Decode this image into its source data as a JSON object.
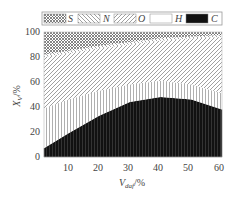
{
  "chart_data": {
    "type": "area",
    "stacked": true,
    "title": "",
    "xlabel": "V_daf/%",
    "ylabel": "X_V/%",
    "xlim": [
      2,
      60
    ],
    "ylim": [
      0,
      100
    ],
    "xticks": [
      10,
      20,
      30,
      40,
      50,
      60
    ],
    "yticks": [
      0,
      20,
      40,
      60,
      80,
      100
    ],
    "grid": false,
    "legend_position": "top",
    "x": [
      2,
      10,
      20,
      30,
      40,
      50,
      60
    ],
    "series": [
      {
        "name": "C",
        "pattern": "solid-black",
        "values": [
          7,
          19,
          33,
          44,
          48,
          46,
          38
        ]
      },
      {
        "name": "H",
        "pattern": "white-vertical-lines",
        "values": [
          32,
          27,
          20,
          14,
          13,
          12,
          13
        ]
      },
      {
        "name": "O",
        "pattern": "diagonal-hatch",
        "values": [
          41,
          37,
          34,
          32,
          32,
          37,
          45
        ]
      },
      {
        "name": "N",
        "pattern": "back-diagonal-hatch",
        "values": [
          2,
          2,
          2,
          2,
          2,
          1.5,
          1.5
        ]
      },
      {
        "name": "S",
        "pattern": "crosshatch",
        "values": [
          18,
          15,
          11,
          8,
          5,
          3.5,
          2.5
        ]
      }
    ]
  },
  "legend": {
    "items": [
      {
        "label": "S",
        "pattern": "crosshatch"
      },
      {
        "label": "N",
        "pattern": "back-diagonal-hatch"
      },
      {
        "label": "O",
        "pattern": "diagonal-hatch"
      },
      {
        "label": "H",
        "pattern": "white"
      },
      {
        "label": "C",
        "pattern": "solid-black"
      }
    ]
  },
  "axes": {
    "xlabel_main": "V",
    "xlabel_sub": "daf",
    "xlabel_unit": "/%",
    "ylabel_main": "X",
    "ylabel_sub": "V",
    "ylabel_unit": "/%",
    "xtick_labels": [
      "10",
      "20",
      "30",
      "40",
      "50",
      "60"
    ],
    "ytick_labels": [
      "0",
      "20",
      "40",
      "60",
      "80",
      "100"
    ]
  },
  "colors": {
    "c_fill": "#111111",
    "hatch": "#777777",
    "frame": "#999999"
  }
}
